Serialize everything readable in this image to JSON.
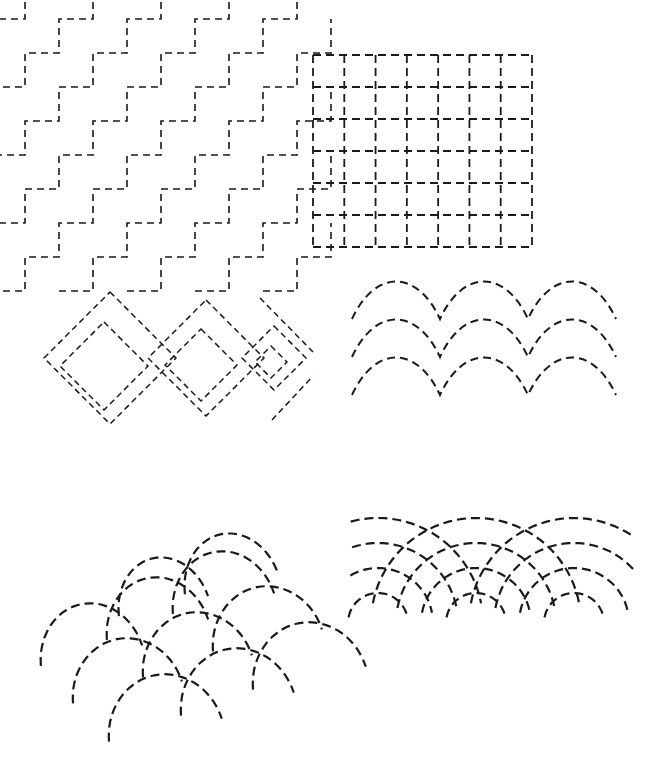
{
  "plate": {
    "title": "Quilting Stitch Pattern Plate",
    "width": 653,
    "height": 762,
    "background_color": "#ffffff",
    "ink_color": "#1a1a1a",
    "description": "Six hand-drawn dashed-line quilting / sashiko stitch motifs arranged in a three-row, two-column plate on plain white paper. No text labels appear in the image."
  },
  "panels": [
    {
      "id": "staircase",
      "name": "Interlocking Staircase Steps",
      "position": "top-left",
      "x": 25,
      "y": 42,
      "width": 215,
      "height": 215,
      "motif": "stepped-zigzag",
      "stroke_width": 1.6,
      "dash_pattern": "7 5",
      "geometry": {
        "step": 34,
        "rows": 6,
        "cols": 6,
        "offset_x": 34,
        "offset_y": 34
      }
    },
    {
      "id": "grid",
      "name": "Dashed Square Grid",
      "position": "top-right",
      "x": 313,
      "y": 55,
      "width": 219,
      "height": 192,
      "motif": "orthogonal-grid",
      "stroke_width": 1.8,
      "dash_pattern": "8 5",
      "geometry": {
        "columns": 7,
        "rows": 6,
        "cell_width": 31.3,
        "cell_height": 32.0
      }
    },
    {
      "id": "diamonds",
      "name": "Diminishing Nested Diamonds",
      "position": "middle-left",
      "x": 28,
      "y": 272,
      "width": 285,
      "height": 172,
      "motif": "nested-rotated-squares",
      "stroke_width": 1.5,
      "dash_pattern": "6 4",
      "geometry": {
        "clusters": 3,
        "rings_per_cluster": 2,
        "sizes": [
          84,
          54,
          26
        ],
        "rotation_deg": 45
      }
    },
    {
      "id": "scallops",
      "name": "Scalloped Wave Rows",
      "position": "middle-right",
      "x": 352,
      "y": 283,
      "width": 265,
      "height": 95,
      "motif": "scallop-rows",
      "stroke_width": 2.0,
      "dash_pattern": "8 5",
      "geometry": {
        "rows": 3,
        "arcs_per_row": 3,
        "arc_width": 88,
        "arc_height": 40,
        "row_spacing": 38
      }
    },
    {
      "id": "fanscale",
      "name": "Perspective Fish-Scale Fan",
      "position": "bottom-left",
      "x": 55,
      "y": 495,
      "width": 260,
      "height": 235,
      "motif": "seigaiha-perspective",
      "stroke_width": 2.2,
      "dash_pattern": "9 5",
      "geometry": {
        "scale_rows": 3,
        "scales_per_row": 3,
        "skew_deg": -14
      }
    },
    {
      "id": "quarterfans",
      "name": "Concentric Quarter-Arc Fans",
      "position": "bottom-right",
      "x": 368,
      "y": 505,
      "width": 245,
      "height": 115,
      "motif": "concentric-quarter-arcs",
      "stroke_width": 2.2,
      "dash_pattern": "9 5",
      "geometry": {
        "fan_count": 3,
        "arcs_per_fan": 4,
        "radii": [
          30,
          55,
          80,
          105
        ]
      }
    }
  ]
}
